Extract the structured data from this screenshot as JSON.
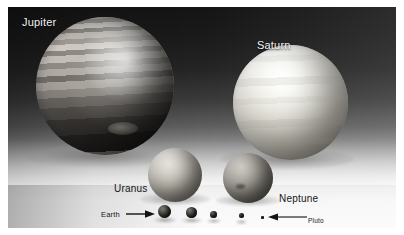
{
  "figure": {
    "caption_type": "planet-size-comparison-photo",
    "medium": "grayscale photograph of scale model spheres"
  },
  "labels": {
    "jupiter": "Jupiter",
    "saturn": "Saturn",
    "uranus": "Uranus",
    "neptune": "Neptune",
    "earth": "Earth",
    "pluto": "Pluto"
  },
  "colors": {
    "page_background": "#ffffff",
    "sky_dark": "#141414",
    "table_light": "#fbfbfb",
    "label_light": "#f2f2f2",
    "label_dark": "#161616"
  },
  "objects": [
    {
      "name": "jupiter",
      "label": "Jupiter",
      "relative_size": "largest",
      "tone": "banded light and dark grey"
    },
    {
      "name": "saturn",
      "label": "Saturn",
      "relative_size": "second",
      "tone": "bright pale cream"
    },
    {
      "name": "uranus",
      "label": "Uranus",
      "relative_size": "third",
      "tone": "light grey"
    },
    {
      "name": "neptune",
      "label": "Neptune",
      "relative_size": "fourth",
      "tone": "medium grey"
    },
    {
      "name": "earth",
      "label": "Earth",
      "relative_size": "small",
      "tone": "dark"
    },
    {
      "name": "venus",
      "label": "",
      "relative_size": "small",
      "tone": "dark"
    },
    {
      "name": "mars",
      "label": "",
      "relative_size": "smaller",
      "tone": "dark"
    },
    {
      "name": "mercury",
      "label": "",
      "relative_size": "smaller",
      "tone": "dark"
    },
    {
      "name": "pluto",
      "label": "Pluto",
      "relative_size": "smallest",
      "tone": "dark speck"
    }
  ],
  "annotations": {
    "earth_arrow_direction": "right",
    "pluto_arrow_direction": "left"
  }
}
